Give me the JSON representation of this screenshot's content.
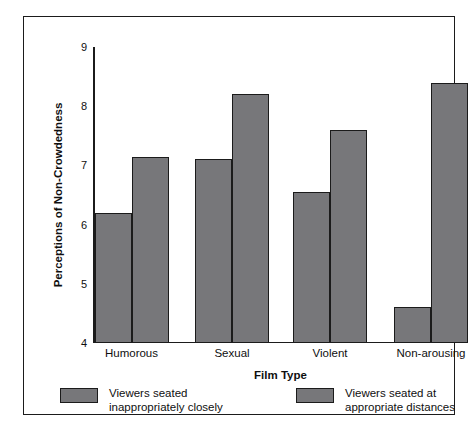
{
  "chart_data": {
    "type": "bar",
    "title": "",
    "xlabel": "Film Type",
    "ylabel": "Perceptions of Non-Crowdedness",
    "categories": [
      "Humorous",
      "Sexual",
      "Violent",
      "Non-arousing"
    ],
    "series": [
      {
        "name": "Viewers seated\ninappropriately closely",
        "values": [
          6.2,
          7.1,
          6.55,
          4.6
        ]
      },
      {
        "name": "Viewers seated at\nappropriate distances",
        "values": [
          7.15,
          8.2,
          7.6,
          8.4
        ]
      }
    ],
    "ylim": [
      4,
      9
    ],
    "yticks": [
      4,
      5,
      6,
      7,
      8,
      9
    ],
    "ytick_labels": [
      "4",
      "5",
      "6",
      "7",
      "8",
      "9"
    ],
    "grid": false,
    "legend_position": "below-axes",
    "bar_color": "#77777a",
    "bar_edge_color": "#1b1b1b",
    "frame_color": "#1b1b1b",
    "text_color": "#0f0f0f"
  },
  "legend": {
    "entries": [
      {
        "label": "Viewers seated\ninappropriately closely"
      },
      {
        "label": "Viewers seated at\nappropriate distances"
      }
    ]
  }
}
